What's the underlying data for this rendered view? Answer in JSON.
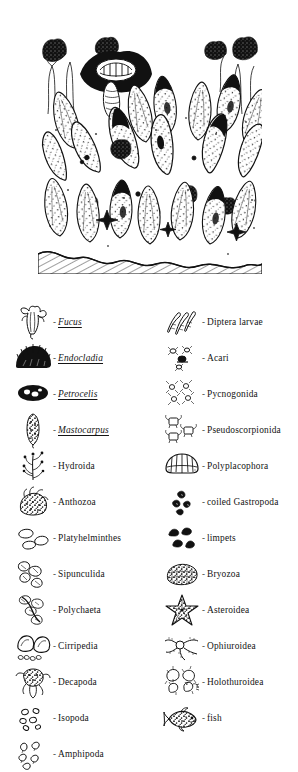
{
  "figure": {
    "illustration": {
      "name": "intertidal-zone-community-illustration",
      "description": "Black-and-white pen-and-ink drawing of a dense rocky intertidal community of goose barnacles, mussels, algae and associated invertebrates on a hatched rock substrate",
      "style": "pen-and-ink line drawing",
      "ink_color": "#111111",
      "background_color": "#ffffff"
    },
    "legend": {
      "columns": [
        {
          "name": "left-column",
          "entries": [
            {
              "icon": "fucus-frond-icon",
              "dash": "-",
              "label": "Fucus",
              "italic_underlined": true
            },
            {
              "icon": "endocladia-turf-icon",
              "dash": "-",
              "label": "Endocladia",
              "italic_underlined": true
            },
            {
              "icon": "petrocelis-crust-icon",
              "dash": "-",
              "label": "Petrocelis",
              "italic_underlined": true
            },
            {
              "icon": "mastocarpus-blade-icon",
              "dash": "-",
              "label": "Mastocarpus",
              "italic_underlined": true
            },
            {
              "icon": "hydroida-colony-icon",
              "dash": "-",
              "label": "Hydroida",
              "italic_underlined": false
            },
            {
              "icon": "anthozoa-anemone-icon",
              "dash": "-",
              "label": "Anthozoa",
              "italic_underlined": false
            },
            {
              "icon": "platyhelminthes-flatworm-icon",
              "dash": "-",
              "label": "Platyhelminthes",
              "italic_underlined": false
            },
            {
              "icon": "sipunculida-peanutworm-icon",
              "dash": "-",
              "label": "Sipunculida",
              "italic_underlined": false
            },
            {
              "icon": "polychaeta-bristleworm-icon",
              "dash": "-",
              "label": "Polychaeta",
              "italic_underlined": false
            },
            {
              "icon": "cirripedia-barnacle-icon",
              "dash": "-",
              "label": "Cirripedia",
              "italic_underlined": false
            },
            {
              "icon": "decapoda-crab-icon",
              "dash": "-",
              "label": "Decapoda",
              "italic_underlined": false
            },
            {
              "icon": "isopoda-icon",
              "dash": "-",
              "label": "Isopoda",
              "italic_underlined": false
            },
            {
              "icon": "amphipoda-icon",
              "dash": "-",
              "label": "Amphipoda",
              "italic_underlined": false
            }
          ]
        },
        {
          "name": "right-column",
          "entries": [
            {
              "icon": "diptera-larvae-icon",
              "dash": "-",
              "label": "Diptera larvae",
              "italic_underlined": false
            },
            {
              "icon": "acari-mite-icon",
              "dash": "-",
              "label": "Acari",
              "italic_underlined": false
            },
            {
              "icon": "pycnogonida-seaspider-icon",
              "dash": "-",
              "label": "Pycnogonida",
              "italic_underlined": false
            },
            {
              "icon": "pseudoscorpionida-icon",
              "dash": "-",
              "label": "Pseudoscorpionida",
              "italic_underlined": false
            },
            {
              "icon": "polyplacophora-chiton-icon",
              "dash": "-",
              "label": "Polyplacophora",
              "italic_underlined": false
            },
            {
              "icon": "coiled-gastropoda-icon",
              "dash": "-",
              "label": "coiled Gastropoda",
              "italic_underlined": false
            },
            {
              "icon": "limpets-icon",
              "dash": "-",
              "label": "limpets",
              "italic_underlined": false
            },
            {
              "icon": "bryozoa-colony-icon",
              "dash": "-",
              "label": "Bryozoa",
              "italic_underlined": false
            },
            {
              "icon": "asteroidea-seastar-icon",
              "dash": "-",
              "label": "Asteroidea",
              "italic_underlined": false
            },
            {
              "icon": "ophiuroidea-brittlestar-icon",
              "dash": "-",
              "label": "Ophiuroidea",
              "italic_underlined": false
            },
            {
              "icon": "holothuroidea-seacucumber-icon",
              "dash": "-",
              "label": "Holothuroidea",
              "italic_underlined": false
            },
            {
              "icon": "fish-icon",
              "dash": "-",
              "label": "fish",
              "italic_underlined": false
            }
          ]
        }
      ]
    }
  }
}
